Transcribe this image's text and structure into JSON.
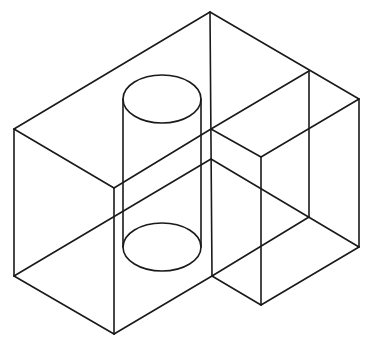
{
  "diagram": {
    "type": "isometric-wireframe",
    "stroke_color": "#1a1a1a",
    "background": "#ffffff",
    "vertices": {
      "apex": [
        210,
        12
      ],
      "left_top": [
        14,
        129
      ],
      "front_top": [
        114,
        188
      ],
      "left_bottom": [
        14,
        276
      ],
      "front_bottom": [
        114,
        334
      ],
      "center_top": [
        211,
        129
      ],
      "center_step": [
        211,
        159
      ],
      "center_bottom": [
        212,
        276
      ],
      "step_back_top": [
        309,
        71
      ],
      "right_top": [
        359,
        99
      ],
      "right_bottom": [
        359,
        247
      ],
      "step_front_top": [
        261,
        157
      ],
      "step_front_bottom": [
        261,
        305
      ],
      "step_back_bottom": [
        309,
        217
      ]
    },
    "edges": [
      [
        "left_top",
        "apex"
      ],
      [
        "apex",
        "right_top"
      ],
      [
        "left_top",
        "front_top"
      ],
      [
        "front_top",
        "center_top"
      ],
      [
        "center_top",
        "step_back_top"
      ],
      [
        "left_top",
        "left_bottom"
      ],
      [
        "front_top",
        "front_bottom"
      ],
      [
        "left_bottom",
        "front_bottom"
      ],
      [
        "front_bottom",
        "center_bottom"
      ],
      [
        "left_bottom",
        "center_step"
      ],
      [
        "apex",
        "center_bottom"
      ],
      [
        "center_top",
        "step_front_top"
      ],
      [
        "step_front_top",
        "right_top"
      ],
      [
        "step_back_top",
        "step_back_bottom"
      ],
      [
        "right_top",
        "right_bottom"
      ],
      [
        "step_front_top",
        "step_front_bottom"
      ],
      [
        "center_step",
        "right_bottom"
      ],
      [
        "center_bottom",
        "step_front_bottom"
      ],
      [
        "step_front_bottom",
        "right_bottom"
      ],
      [
        "center_bottom",
        "step_back_bottom"
      ]
    ],
    "cylinder": {
      "top_ellipse": {
        "cx": 162,
        "cy": 99,
        "rx": 39,
        "ry": 24
      },
      "bottom_ellipse": {
        "cx": 162,
        "cy": 247,
        "rx": 39,
        "ry": 24
      },
      "left_x": 123,
      "right_x": 201
    }
  }
}
